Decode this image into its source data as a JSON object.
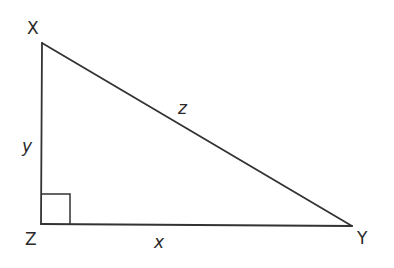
{
  "diagram": {
    "type": "right-triangle",
    "stroke_color": "#333333",
    "vertices": [
      {
        "name": "X",
        "x": 42,
        "y": 43
      },
      {
        "name": "Y",
        "x": 352,
        "y": 226
      },
      {
        "name": "Z",
        "x": 41,
        "y": 224
      }
    ],
    "right_angle_at": "Z",
    "vertex_labels": {
      "X": "X",
      "Y": "Y",
      "Z": "Z"
    },
    "side_labels": {
      "XZ": "y",
      "ZY": "x",
      "XY": "z"
    }
  }
}
